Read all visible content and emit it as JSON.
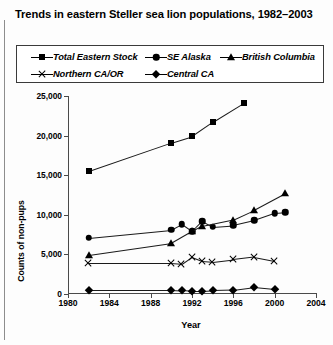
{
  "title": "Trends in eastern Steller sea lion populations, 1982–2003",
  "legend": {
    "rows": [
      [
        {
          "label": "Total Eastern Stock",
          "marker": "square-marker",
          "x": 14
        },
        {
          "label": "SE Alaska",
          "marker": "circle-marker",
          "x": 128
        },
        {
          "label": "British Columbia",
          "marker": "triangle-marker",
          "x": 203
        }
      ],
      [
        {
          "label": "Northern CA/OR",
          "marker": "x-marker",
          "x": 14
        },
        {
          "label": "Central CA",
          "marker": "diamond-marker",
          "x": 128
        }
      ]
    ]
  },
  "chart_data": {
    "type": "line",
    "title": "Trends in eastern Steller sea lion populations, 1982–2003",
    "xlabel": "Year",
    "ylabel": "Counts of non-pups",
    "xlim": [
      1980,
      2004
    ],
    "ylim": [
      0,
      25000
    ],
    "xticks": [
      1980,
      1984,
      1988,
      1992,
      1996,
      2000,
      2004
    ],
    "xtick_labels": [
      "1980",
      "1984",
      "1988",
      "1992",
      "1996",
      "2000",
      "2004"
    ],
    "yticks": [
      0,
      5000,
      10000,
      15000,
      20000,
      25000
    ],
    "ytick_labels": [
      "0",
      "5,000",
      "10,000",
      "15,000",
      "20,000",
      "25,000"
    ],
    "grid": false,
    "legend_position": "above-plot",
    "series": [
      {
        "name": "Total Eastern Stock",
        "marker": "square-marker",
        "points": [
          [
            1982,
            15500
          ],
          [
            1990,
            19100
          ],
          [
            1992,
            19900
          ],
          [
            1994,
            21700
          ],
          [
            1997,
            24100
          ]
        ]
      },
      {
        "name": "SE Alaska",
        "marker": "circle-marker",
        "points": [
          [
            1982,
            7100
          ],
          [
            1990,
            8100
          ],
          [
            1991,
            8800
          ],
          [
            1992,
            7900
          ],
          [
            1993,
            9200
          ],
          [
            1994,
            8500
          ],
          [
            1996,
            8700
          ],
          [
            1998,
            9300
          ],
          [
            2000,
            10200
          ],
          [
            2001,
            10300
          ]
        ]
      },
      {
        "name": "British Columbia",
        "marker": "triangle-marker",
        "points": [
          [
            1982,
            4900
          ],
          [
            1990,
            6400
          ],
          [
            1992,
            7900
          ],
          [
            1993,
            8600
          ],
          [
            1996,
            9400
          ],
          [
            1998,
            10600
          ],
          [
            2001,
            12700
          ]
        ]
      },
      {
        "name": "Northern CA/OR",
        "marker": "x-marker",
        "points": [
          [
            1982,
            3900
          ],
          [
            1990,
            3900
          ],
          [
            1991,
            3800
          ],
          [
            1992,
            4700
          ],
          [
            1993,
            4200
          ],
          [
            1994,
            4100
          ],
          [
            1996,
            4400
          ],
          [
            1998,
            4700
          ],
          [
            2000,
            4200
          ]
        ]
      },
      {
        "name": "Central CA",
        "marker": "diamond-marker",
        "points": [
          [
            1982,
            550
          ],
          [
            1990,
            550
          ],
          [
            1991,
            500
          ],
          [
            1992,
            400
          ],
          [
            1993,
            400
          ],
          [
            1994,
            450
          ],
          [
            1996,
            500
          ],
          [
            1998,
            850
          ],
          [
            2000,
            600
          ]
        ]
      }
    ]
  }
}
